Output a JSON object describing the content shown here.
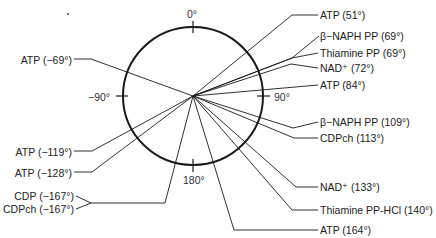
{
  "diagram": {
    "type": "polar-angle-diagram",
    "axis_labels": {
      "top": "0°",
      "right": "90°",
      "bottom": "180°",
      "left": "−90°"
    },
    "right_entries": [
      {
        "name": "ATP",
        "angle": "(51°)",
        "text": "ATP (51°)"
      },
      {
        "name": "β−NAPH PP",
        "angle": "(69°)",
        "text": "β−NAPH PP (69°)"
      },
      {
        "name": "Thiamine PP",
        "angle": "(69°)",
        "text": "Thiamine PP (69°)"
      },
      {
        "name": "NAD+",
        "angle": "(72°)",
        "text": "NAD⁺  (72°)"
      },
      {
        "name": "ATP",
        "angle": "(84°)",
        "text": "ATP (84°)"
      },
      {
        "name": "β−NAPH PP",
        "angle": "(109°)",
        "text": "β−NAPH PP (109°)"
      },
      {
        "name": "CDPch",
        "angle": "(113°)",
        "text": "CDPch (113°)"
      },
      {
        "name": "NAD+",
        "angle": "(133°)",
        "text": "NAD⁺  (133°)"
      },
      {
        "name": "Thiamine PP-HCl",
        "angle": "(140°)",
        "text": "Thiamine PP-HCl (140°)"
      },
      {
        "name": "ATP",
        "angle": "(164°)",
        "text": "ATP (164°)"
      }
    ],
    "left_entries": [
      {
        "name": "ATP",
        "angle": "(−69°)",
        "text": "ATP (−69°)"
      },
      {
        "name": "ATP",
        "angle": "(−119°)",
        "text": "ATP (−119°)"
      },
      {
        "name": "ATP",
        "angle": "(−128°)",
        "text": "ATP (−128°)"
      },
      {
        "name": "CDP",
        "angle": "(−167°)",
        "text": "CDP (−167°)"
      },
      {
        "name": "CDPch",
        "angle": "(−167°)",
        "text": "CDPch (−167°)"
      }
    ],
    "colors": {
      "line": "#1a1a1a",
      "text": "#222222",
      "background": "#ffffff"
    }
  }
}
